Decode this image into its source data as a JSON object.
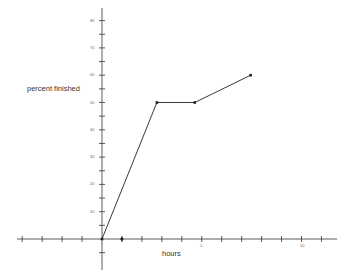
{
  "chart_data": {
    "type": "line",
    "title": "",
    "xlabel": "hours",
    "ylabel": "percent finished",
    "x": [
      0,
      2.75,
      4.65,
      7.45
    ],
    "series": [
      {
        "name": "progress",
        "values": [
          0,
          50,
          50,
          60
        ]
      }
    ],
    "x_tick_labels": [
      {
        "value": 5,
        "label": "5"
      },
      {
        "value": 10,
        "label": "10"
      }
    ],
    "y_tick_labels": [
      {
        "value": 10,
        "label": "10"
      },
      {
        "value": 20,
        "label": "20"
      },
      {
        "value": 30,
        "label": "30"
      },
      {
        "value": 40,
        "label": "40"
      },
      {
        "value": 50,
        "label": "50"
      },
      {
        "value": 60,
        "label": "60"
      },
      {
        "value": 70,
        "label": "70"
      },
      {
        "value": 80,
        "label": "80"
      }
    ],
    "xlim": [
      -4,
      11.5
    ],
    "ylim": [
      -10,
      85
    ],
    "x_minor_step": 1,
    "y_minor_step": 5,
    "grid": false,
    "legend": "none",
    "marker_on_x_axis": 1
  },
  "colors": {
    "axis": "#333333",
    "line": "#222222",
    "text": "#333333"
  }
}
